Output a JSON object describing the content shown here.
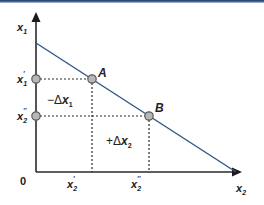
{
  "diagram": {
    "type": "budget-line-tradeoff",
    "colors": {
      "axis": "#2a2a2a",
      "line": "#2f5688",
      "guide": "#2a2a2a",
      "point_fill": "#b7b7b7",
      "point_stroke": "#5a5a5a",
      "top_border": "#2b4a78"
    },
    "axes": {
      "y_label": {
        "base": "x",
        "sub": "1"
      },
      "x_label": {
        "base": "x",
        "sub": "2"
      },
      "origin": "0"
    },
    "y_ticks": [
      {
        "base": "x",
        "sub": "1",
        "prime": "'",
        "id": "x1-prime"
      },
      {
        "base": "x",
        "sub": "2",
        "prime": "''",
        "id": "x2-double-prime"
      }
    ],
    "x_ticks": [
      {
        "base": "x",
        "sub": "2",
        "prime": "'",
        "id": "x2-prime"
      },
      {
        "base": "x",
        "sub": "2",
        "prime": "''",
        "id": "x2-double-prime"
      }
    ],
    "points": [
      {
        "label": "A"
      },
      {
        "label": "B"
      }
    ],
    "annotations": {
      "minus_delta": {
        "sign": "−Δ",
        "base": "x",
        "sub": "1"
      },
      "plus_delta": {
        "sign": "+Δ",
        "base": "x",
        "sub": "2"
      }
    }
  }
}
